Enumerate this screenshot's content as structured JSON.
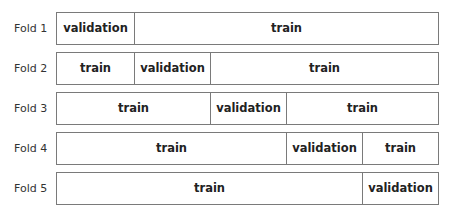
{
  "diagram": {
    "title": "",
    "segment_count": 5,
    "folds": [
      {
        "label": "Fold 1",
        "segments": [
          {
            "text": "validation",
            "span": 1
          },
          {
            "text": "train",
            "span": 4
          }
        ]
      },
      {
        "label": "Fold 2",
        "segments": [
          {
            "text": "train",
            "span": 1
          },
          {
            "text": "validation",
            "span": 1
          },
          {
            "text": "train",
            "span": 3
          }
        ]
      },
      {
        "label": "Fold 3",
        "segments": [
          {
            "text": "train",
            "span": 2
          },
          {
            "text": "validation",
            "span": 1
          },
          {
            "text": "train",
            "span": 2
          }
        ]
      },
      {
        "label": "Fold 4",
        "segments": [
          {
            "text": "train",
            "span": 3
          },
          {
            "text": "validation",
            "span": 1
          },
          {
            "text": "train",
            "span": 1
          }
        ]
      },
      {
        "label": "Fold 5",
        "segments": [
          {
            "text": "train",
            "span": 4
          },
          {
            "text": "validation",
            "span": 1
          }
        ]
      }
    ]
  },
  "colors": {
    "border": "#7a7a7a",
    "text": "#222222",
    "background": "#ffffff"
  }
}
